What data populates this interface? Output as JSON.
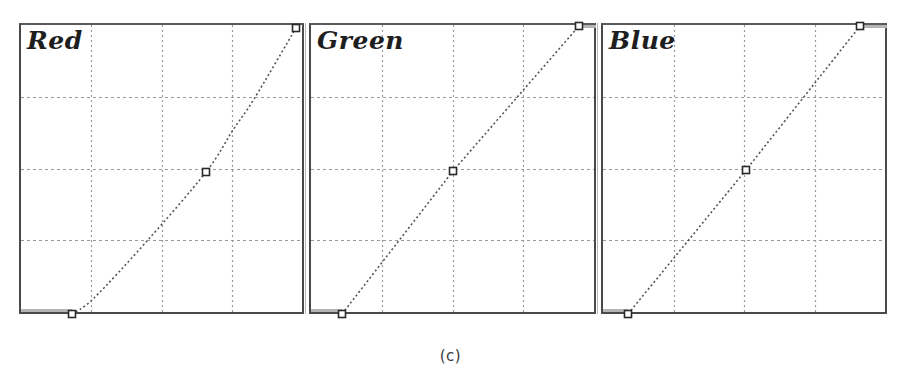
{
  "figure": {
    "caption": "(c)"
  },
  "panels": [
    {
      "label": "Red",
      "channel": "red",
      "box": {
        "left": 19,
        "width": 285
      },
      "control_points": [
        [
          0,
          0
        ],
        [
          128,
          128
        ],
        [
          255,
          255
        ]
      ],
      "curve_px": [
        [
          51,
          289
        ],
        [
          73,
          273
        ],
        [
          126,
          216
        ],
        [
          185,
          147
        ],
        [
          212,
          105
        ],
        [
          233,
          74
        ],
        [
          275,
          3
        ]
      ],
      "handles_px": [
        [
          51,
          289
        ],
        [
          185,
          147
        ],
        [
          275,
          3
        ]
      ],
      "shade_left_px": [
        0,
        51
      ],
      "shade_right_px": null
    },
    {
      "label": "Green",
      "channel": "green",
      "box": {
        "left": 309,
        "width": 287
      },
      "control_points": [
        [
          0,
          0
        ],
        [
          128,
          128
        ],
        [
          255,
          255
        ]
      ],
      "curve_px": [
        [
          31,
          289
        ],
        [
          142,
          146
        ],
        [
          268,
          1
        ]
      ],
      "handles_px": [
        [
          31,
          289
        ],
        [
          142,
          146
        ],
        [
          268,
          1
        ]
      ],
      "shade_left_px": [
        0,
        31
      ],
      "shade_right_px": [
        268,
        285
      ]
    },
    {
      "label": "Blue",
      "channel": "blue",
      "box": {
        "left": 601,
        "width": 286
      },
      "control_points": [
        [
          0,
          0
        ],
        [
          128,
          128
        ],
        [
          255,
          255
        ]
      ],
      "curve_px": [
        [
          25,
          289
        ],
        [
          143,
          145
        ],
        [
          257,
          1
        ]
      ],
      "handles_px": [
        [
          25,
          289
        ],
        [
          143,
          145
        ],
        [
          257,
          1
        ]
      ],
      "shade_left_px": [
        0,
        25
      ],
      "shade_right_px": [
        257,
        284
      ]
    }
  ],
  "colors": {
    "border": "#4a4a4a",
    "grid": "#9a9a9a",
    "curve": "#555555",
    "handle": "#2a2a2a",
    "shade": "#b5b5b5"
  },
  "chart_data": [
    {
      "type": "line",
      "title": "Red",
      "xlabel": "Input",
      "ylabel": "Output",
      "xlim": [
        0,
        255
      ],
      "ylim": [
        0,
        255
      ],
      "grid": true,
      "grid_divisions": 4,
      "series": [
        {
          "name": "Red curve",
          "x": [
            0,
            20,
            64,
            128,
            160,
            192,
            255
          ],
          "y": [
            0,
            14,
            63,
            128,
            165,
            192,
            255
          ],
          "control_points": [
            [
              0,
              0
            ],
            [
              128,
              128
            ],
            [
              255,
              255
            ]
          ]
        }
      ]
    },
    {
      "type": "line",
      "title": "Green",
      "xlabel": "Input",
      "ylabel": "Output",
      "xlim": [
        0,
        255
      ],
      "ylim": [
        0,
        255
      ],
      "grid": true,
      "grid_divisions": 4,
      "series": [
        {
          "name": "Green curve",
          "x": [
            0,
            128,
            255
          ],
          "y": [
            0,
            128,
            255
          ],
          "control_points": [
            [
              0,
              0
            ],
            [
              128,
              128
            ],
            [
              255,
              255
            ]
          ]
        }
      ]
    },
    {
      "type": "line",
      "title": "Blue",
      "xlabel": "Input",
      "ylabel": "Output",
      "xlim": [
        0,
        255
      ],
      "ylim": [
        0,
        255
      ],
      "grid": true,
      "grid_divisions": 4,
      "series": [
        {
          "name": "Blue curve",
          "x": [
            0,
            128,
            255
          ],
          "y": [
            0,
            128,
            255
          ],
          "control_points": [
            [
              0,
              0
            ],
            [
              128,
              128
            ],
            [
              255,
              255
            ]
          ]
        }
      ]
    }
  ]
}
